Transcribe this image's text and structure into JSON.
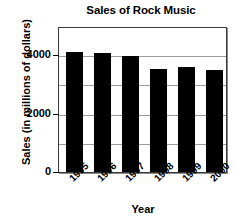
{
  "chart_data": {
    "type": "bar",
    "title": "Sales of Rock Music",
    "xlabel": "Year",
    "ylabel": "Sales (in millions of dollars)",
    "categories": [
      "1995",
      "1996",
      "1997",
      "1998",
      "1999",
      "2000"
    ],
    "values": [
      4100,
      4075,
      3975,
      3520,
      3600,
      3500
    ],
    "series": [
      {
        "name": "Sales",
        "values": [
          4100,
          4075,
          3975,
          3520,
          3600,
          3500
        ]
      }
    ],
    "ylim": [
      0,
      5000
    ],
    "y_ticks": [
      0,
      2000,
      4000
    ],
    "y_tick_labels": [
      "0",
      "2000",
      "4000"
    ],
    "gridlines": [
      1000,
      2000,
      3000,
      4000
    ],
    "grid": true,
    "legend": "none",
    "bar_color": "#000000",
    "plot_background": "#ffffff",
    "grid_color": "#9b9b9b",
    "frame_color": "#3a3a3a",
    "text_color": "#000000"
  }
}
